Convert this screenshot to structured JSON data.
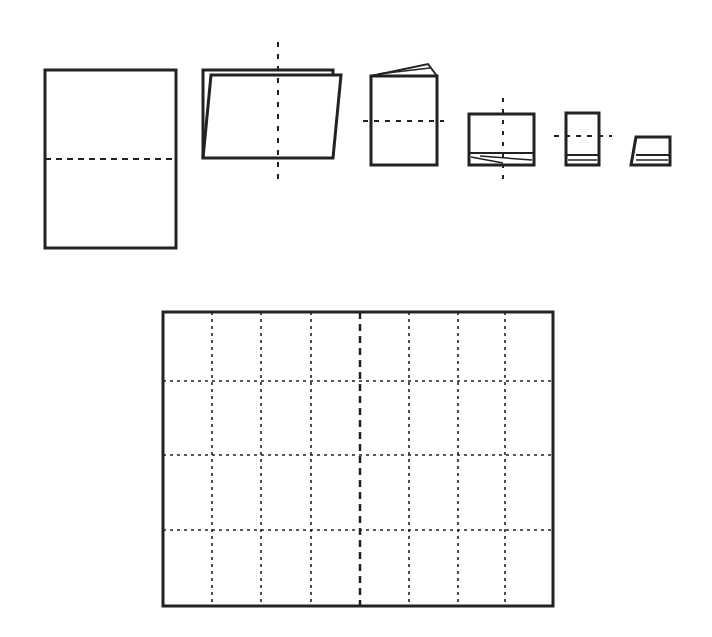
{
  "diagram": {
    "type": "paper-folding-sequence",
    "stroke_color": "#222222",
    "background": "#ffffff",
    "steps": [
      {
        "id": "step-1",
        "description": "full sheet with horizontal fold line"
      },
      {
        "id": "step-2",
        "description": "folded in half, vertical fold line"
      },
      {
        "id": "step-3",
        "description": "folded again, horizontal fold line"
      },
      {
        "id": "step-4",
        "description": "folded again, vertical fold line"
      },
      {
        "id": "step-5",
        "description": "folded again, horizontal fold line"
      },
      {
        "id": "step-6",
        "description": "final folded packet"
      }
    ],
    "unfolded_sheet": {
      "description": "unfolded sheet showing crease grid",
      "columns": 8,
      "rows": 4
    }
  }
}
